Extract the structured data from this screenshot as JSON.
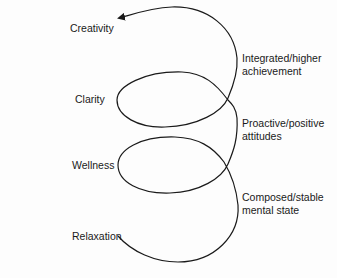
{
  "diagram": {
    "type": "upward spiral",
    "levels_left": [
      {
        "label": "Creativity"
      },
      {
        "label": "Clarity"
      },
      {
        "label": "Wellness"
      },
      {
        "label": "Relaxation"
      }
    ],
    "stages_right": [
      {
        "line1": "Integrated/higher",
        "line2": "achievement"
      },
      {
        "line1": "Proactive/positive",
        "line2": "attitudes"
      },
      {
        "line1": "Composed/stable",
        "line2": "mental state"
      }
    ],
    "stroke_color": "#1a1a1a",
    "background": "#fdfdfd"
  }
}
